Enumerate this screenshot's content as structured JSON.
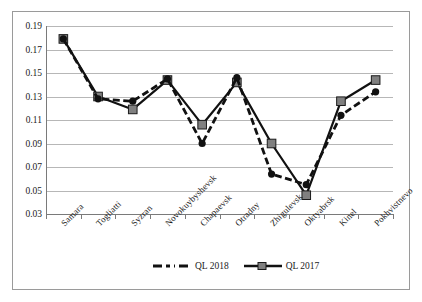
{
  "chart_data": {
    "type": "line",
    "title": "",
    "xlabel": "",
    "ylabel": "",
    "ylim": [
      0.03,
      0.19
    ],
    "ytick_step": 0.02,
    "yticks": [
      "0.19",
      "0.17",
      "0.15",
      "0.13",
      "0.11",
      "0.09",
      "0.07",
      "0.05",
      "0.03"
    ],
    "grid": true,
    "legend_position": "bottom-center",
    "categories": [
      "Samara",
      "Togliatti",
      "Syzran",
      "Novokuybyshevsk",
      "Chapaevsk",
      "Otradny",
      "Zhigulevsk",
      "Oktyabrsk",
      "Kinel",
      "Pokhvistnevo"
    ],
    "series": [
      {
        "name": "QL 2018",
        "style": "dashed",
        "marker": "circle",
        "color": "#111111",
        "values": [
          0.179,
          0.128,
          0.126,
          0.145,
          0.09,
          0.146,
          0.064,
          0.055,
          0.114,
          0.134
        ]
      },
      {
        "name": "QL 2017",
        "style": "solid",
        "marker": "square",
        "color": "#111111",
        "marker_fill": "#808080",
        "values": [
          0.179,
          0.13,
          0.119,
          0.144,
          0.106,
          0.142,
          0.09,
          0.046,
          0.126,
          0.144
        ]
      }
    ]
  },
  "legend": {
    "items": [
      {
        "label": "QL 2018"
      },
      {
        "label": "QL 2017"
      }
    ]
  },
  "colors": {
    "gridline": "#b7b7b7",
    "axis": "#7a7a7a",
    "series_line": "#111111",
    "marker_fill": "#808080",
    "border": "#9a9a9a",
    "text": "#1b1b1b"
  }
}
